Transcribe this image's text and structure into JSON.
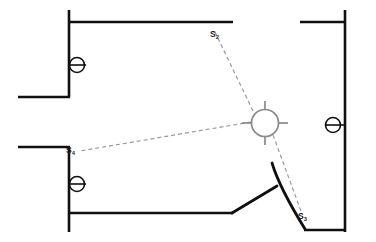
{
  "diagram": {
    "background_color": "#ffffff",
    "wall_color": "#101010",
    "sensor_color": "#8a8a8a",
    "ray_color": "#9a9a9a",
    "sensor": {
      "name": "omni-sensor",
      "icon": "circle-crosshair-icon",
      "cx": 265,
      "cy": 123,
      "r": 14
    },
    "labels": [
      {
        "id": "s2",
        "base": "S",
        "sub": "2",
        "x": 212,
        "y": 36
      },
      {
        "id": "s4",
        "base": "S",
        "sub": "4",
        "x": 68,
        "y": 152
      },
      {
        "id": "s3",
        "base": "S",
        "sub": "3",
        "x": 300,
        "y": 218
      }
    ],
    "rays": [
      {
        "id": "ray-to-s2",
        "from": "sensor",
        "to": "s2"
      },
      {
        "id": "ray-to-s4",
        "from": "sensor",
        "to": "s4"
      },
      {
        "id": "ray-to-s3",
        "from": "sensor",
        "to": "s3"
      }
    ],
    "valves": [
      {
        "id": "valve-upper-left",
        "icon": "valve-icon",
        "cx": 77,
        "cy": 65
      },
      {
        "id": "valve-lower-left",
        "icon": "valve-icon",
        "cx": 77,
        "cy": 184
      },
      {
        "id": "valve-right",
        "icon": "valve-icon",
        "cx": 333,
        "cy": 125
      }
    ],
    "walls": [
      {
        "id": "wall-top-left-vertical",
        "x1": 69,
        "y1": 10,
        "x2": 69,
        "y2": 97
      },
      {
        "id": "wall-top-horizontal",
        "x1": 69,
        "y1": 22,
        "x2": 233,
        "y2": 22
      },
      {
        "id": "wall-upper-left-stub",
        "x1": 18,
        "y1": 97,
        "x2": 69,
        "y2": 97
      },
      {
        "id": "wall-lower-left-stub",
        "x1": 18,
        "y1": 147,
        "x2": 69,
        "y2": 147
      },
      {
        "id": "wall-bottom-left-vertical",
        "x1": 69,
        "y1": 147,
        "x2": 69,
        "y2": 232
      },
      {
        "id": "wall-bottom-horizontal",
        "x1": 69,
        "y1": 213,
        "x2": 232,
        "y2": 213
      },
      {
        "id": "wall-top-right-horizontal",
        "x1": 300,
        "y1": 22,
        "x2": 345,
        "y2": 22
      },
      {
        "id": "wall-right-vertical",
        "x1": 345,
        "y1": 10,
        "x2": 345,
        "y2": 232
      },
      {
        "id": "wall-bottom-right-horizontal",
        "x1": 305,
        "y1": 230,
        "x2": 345,
        "y2": 230
      }
    ],
    "door_leaf": {
      "id": "curved-door-leaf",
      "description": "curved swinging door panel",
      "start": [
        272,
        163
      ],
      "end": [
        305,
        229
      ]
    },
    "diagonal_segment": {
      "id": "floor-diagonal",
      "x1": 232,
      "y1": 213,
      "x2": 277,
      "y2": 186
    }
  }
}
